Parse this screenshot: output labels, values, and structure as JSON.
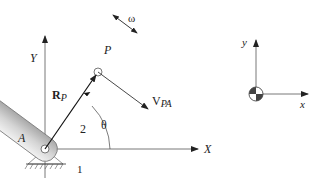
{
  "diagram": {
    "title": "",
    "global_axes": {
      "x_label": "X",
      "y_label": "Y"
    },
    "local_axes": {
      "x_label": "x",
      "y_label": "y"
    },
    "labels": {
      "pivot": "A",
      "point": "P",
      "position_vector": "R",
      "position_vector_sub": "P",
      "velocity": "V",
      "velocity_sub": "PA",
      "angular_velocity": "ω",
      "angle": "θ",
      "link": "2",
      "ground": "1"
    },
    "colors": {
      "line": "#222222",
      "link_fill": "#d8d8d8",
      "link_stroke": "#777777",
      "axis": "#555555"
    }
  }
}
